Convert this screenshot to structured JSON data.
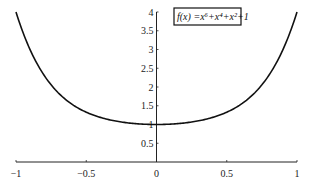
{
  "chart_data": {
    "type": "line",
    "title": "",
    "xlabel": "",
    "ylabel": "",
    "xlim": [
      -1,
      1
    ],
    "ylim": [
      0,
      4
    ],
    "grid": false,
    "x_ticks": [
      -1,
      -0.5,
      0,
      0.5,
      1
    ],
    "x_tick_labels": [
      "−1",
      "−0.5",
      "0",
      "0.5",
      "1"
    ],
    "y_ticks": [
      0.5,
      1,
      1.5,
      2,
      2.5,
      3,
      3.5,
      4
    ],
    "y_tick_labels": [
      "0.5",
      "1",
      "1.5",
      "2",
      "2.5",
      "3",
      "3.5",
      "4"
    ],
    "legend": {
      "position": "top-right-of-y-axis",
      "boxed": true
    },
    "series": [
      {
        "name": "f(x) = x^6+x^4+x^2+1",
        "label_display": "f(x) =x⁶+x⁴+x²+1",
        "function": "x^6+x^4+x^2+1",
        "coefficients_by_power": {
          "6": 1,
          "4": 1,
          "2": 1,
          "0": 1
        },
        "color": "#111111",
        "x": [
          -1,
          -0.9,
          -0.8,
          -0.7,
          -0.6,
          -0.5,
          -0.4,
          -0.3,
          -0.2,
          -0.1,
          0,
          0.1,
          0.2,
          0.3,
          0.4,
          0.5,
          0.6,
          0.7,
          0.8,
          0.9,
          1
        ],
        "y": [
          4,
          3.0,
          2.33,
          1.84,
          1.53,
          1.33,
          1.19,
          1.1,
          1.04,
          1.01,
          1,
          1.01,
          1.04,
          1.1,
          1.19,
          1.33,
          1.53,
          1.84,
          2.33,
          3.0,
          4
        ]
      }
    ]
  }
}
